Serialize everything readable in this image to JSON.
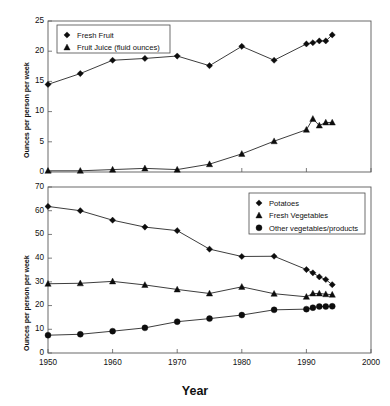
{
  "figure": {
    "xaxis_title": "Year",
    "yaxis_title": "Ounces per person per week",
    "x_ticks": [
      "1950",
      "1960",
      "1970",
      "1980",
      "1990",
      "2000"
    ],
    "top_y_ticks": [
      "0",
      "5",
      "10",
      "15",
      "20",
      "25"
    ],
    "bottom_y_ticks": [
      "0",
      "10",
      "20",
      "30",
      "40",
      "50",
      "60",
      "70"
    ],
    "legend_top": [
      "Fresh Fruit",
      "Fruit Juice (fluid ounces)"
    ],
    "legend_bottom": [
      "Potatoes",
      "Fresh Vegetables",
      "Other vegetables/products"
    ],
    "marker_names": [
      "diamond",
      "triangle",
      "circle"
    ]
  },
  "chart_data": [
    {
      "type": "line",
      "panel": "top",
      "title": "",
      "xlabel": "Year",
      "ylabel": "Ounces per person per week",
      "xlim": [
        1950,
        2000
      ],
      "ylim": [
        0,
        25
      ],
      "ytick_step": 5,
      "xtick_step": 10,
      "grid": false,
      "legend_position": "upper-left",
      "x": [
        1950,
        1955,
        1960,
        1965,
        1970,
        1975,
        1980,
        1985,
        1990,
        1991,
        1992,
        1993,
        1994
      ],
      "series": [
        {
          "name": "Fresh Fruit",
          "marker": "diamond",
          "values": [
            14.5,
            16.3,
            18.5,
            18.8,
            19.2,
            17.6,
            20.8,
            18.5,
            21.2,
            21.4,
            21.7,
            21.7,
            22.7
          ]
        },
        {
          "name": "Fruit Juice (fluid ounces)",
          "marker": "triangle",
          "values": [
            0.2,
            0.2,
            0.4,
            0.6,
            0.4,
            1.3,
            3.0,
            5.1,
            7.0,
            8.8,
            7.7,
            8.2,
            8.2
          ]
        }
      ]
    },
    {
      "type": "line",
      "panel": "bottom",
      "title": "",
      "xlabel": "Year",
      "ylabel": "Ounces per person per week",
      "xlim": [
        1950,
        2000
      ],
      "ylim": [
        0,
        70
      ],
      "ytick_step": 10,
      "xtick_step": 10,
      "grid": false,
      "legend_position": "upper-right",
      "x": [
        1950,
        1955,
        1960,
        1965,
        1970,
        1975,
        1980,
        1985,
        1990,
        1991,
        1992,
        1993,
        1994
      ],
      "series": [
        {
          "name": "Potatoes",
          "marker": "diamond",
          "values": [
            61.8,
            60.0,
            56.0,
            53.1,
            51.6,
            43.8,
            40.7,
            40.8,
            35.2,
            33.8,
            32.1,
            31.0,
            28.8
          ]
        },
        {
          "name": "Fresh Vegetables",
          "marker": "triangle",
          "values": [
            29.2,
            29.4,
            30.2,
            28.7,
            26.8,
            25.1,
            27.9,
            25.0,
            23.7,
            25.1,
            25.1,
            24.8,
            24.6
          ]
        },
        {
          "name": "Other vegetables/products",
          "marker": "circle",
          "values": [
            7.5,
            7.9,
            9.2,
            10.6,
            13.2,
            14.5,
            16.0,
            18.2,
            18.5,
            19.1,
            19.6,
            19.6,
            19.7
          ]
        }
      ]
    }
  ]
}
